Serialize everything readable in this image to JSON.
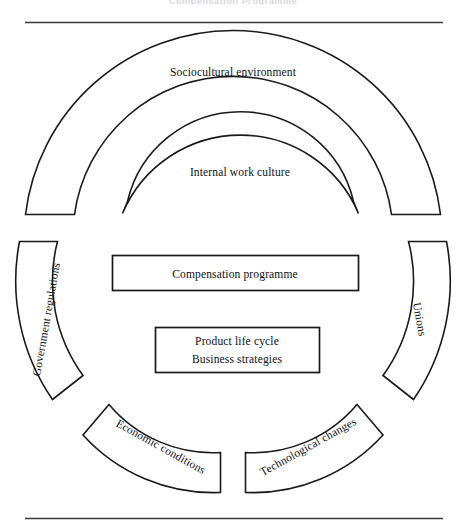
{
  "figure": {
    "title_fragment": "Compensation Programme",
    "top_rule": true,
    "bottom_rule": true
  },
  "rings": {
    "outer": {
      "label": "Sociocultural environment"
    },
    "inner_top": {
      "label": "Internal work culture"
    },
    "left": {
      "label": "Government regulations"
    },
    "right": {
      "label": "Unions"
    },
    "bottom_left": {
      "label": "Economic conditions"
    },
    "bottom_right": {
      "label": "Technological changes"
    }
  },
  "center": {
    "primary_box": {
      "label": "Compensation programme"
    },
    "secondary_box": {
      "line1": "Product life cycle",
      "line2": "Business strategies"
    }
  },
  "colors": {
    "stroke": "#1a1a1a",
    "background": "#ffffff",
    "rule": "#3a3a3a"
  }
}
